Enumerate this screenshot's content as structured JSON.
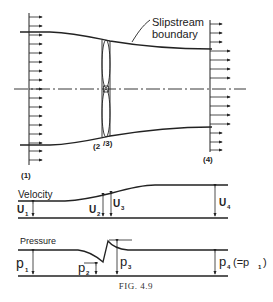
{
  "figure": {
    "caption": "FIG. 4.9",
    "slipstream_label_line1": "Slipstream",
    "slipstream_label_line2": "boundary",
    "stations": {
      "s1": "(1)",
      "s23": "(2)/(3)",
      "s23_a": "(2",
      "s23_b": "/3)",
      "s4": "(4)"
    }
  },
  "velocity_plot": {
    "title": "Velocity",
    "labels": {
      "u1": "U",
      "u1_sub": "1",
      "u2": "U",
      "u2_sub": "2",
      "u3": "U",
      "u3_sub": "3",
      "u4": "U",
      "u4_sub": "4"
    }
  },
  "pressure_plot": {
    "title": "Pressure",
    "labels": {
      "p1": "p",
      "p1_sub": "1",
      "p2": "p",
      "p2_sub": "2",
      "p3": "p",
      "p3_sub": "3",
      "p4": "p",
      "p4_sub": "4",
      "p4_note": "(=p",
      "p4_note_sub": "1",
      "p4_note_end": ")"
    }
  },
  "colors": {
    "ink": "#222222",
    "background": "#ffffff"
  }
}
